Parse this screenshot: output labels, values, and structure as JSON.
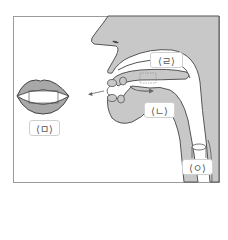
{
  "diagram": {
    "type": "articulation-diagram",
    "colors": {
      "tissue_fill": "#c8c8c8",
      "outline": "#555555",
      "frame": "#9a9a9a",
      "background": "#ffffff",
      "label_border": "#d0d0d0"
    },
    "labels": {
      "rieul": "⟨ㄹ⟩",
      "nieun": "⟨ㄴ⟩",
      "mieum": "⟨ㅁ⟩",
      "ieung": "⟨ㅇ⟩"
    },
    "parts": [
      "lips-front-view",
      "nose",
      "upper-lip",
      "hard-palate",
      "tongue",
      "teeth",
      "lower-jaw",
      "pharynx",
      "larynx",
      "airflow-arrow"
    ]
  }
}
